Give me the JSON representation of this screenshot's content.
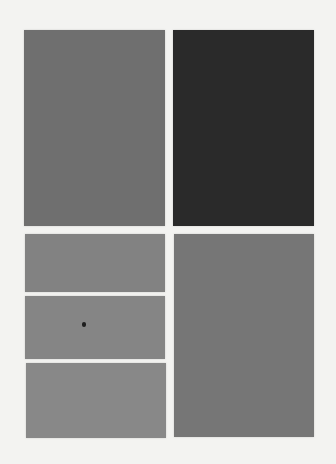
{
  "scene": {
    "background": "#f3f3f1",
    "tiles": [
      {
        "name": "tile-top-left",
        "x": 24,
        "y": 30,
        "w": 141,
        "h": 196,
        "color": "#6f6f6f"
      },
      {
        "name": "tile-top-right",
        "x": 173,
        "y": 30,
        "w": 141,
        "h": 196,
        "color": "#2a2a2a"
      },
      {
        "name": "tile-mid-left-1",
        "x": 25,
        "y": 234,
        "w": 140,
        "h": 58,
        "color": "#828282"
      },
      {
        "name": "tile-mid-left-2",
        "x": 25,
        "y": 296,
        "w": 140,
        "h": 63,
        "color": "#858585"
      },
      {
        "name": "tile-mid-left-3",
        "x": 26,
        "y": 363,
        "w": 140,
        "h": 75,
        "color": "#888888"
      },
      {
        "name": "tile-bottom-right",
        "x": 174,
        "y": 234,
        "w": 140,
        "h": 203,
        "color": "#767676"
      }
    ],
    "marks": [
      {
        "name": "dark-spot",
        "x": 82,
        "y": 322,
        "color": "#1e1e1e"
      }
    ]
  }
}
